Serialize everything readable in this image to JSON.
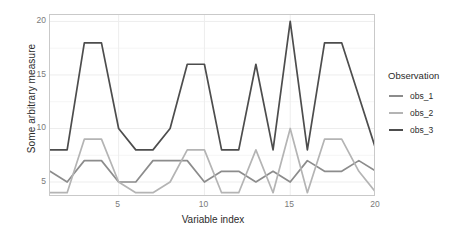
{
  "chart_data": {
    "type": "line",
    "title": "",
    "xlabel": "Variable index",
    "ylabel": "Some arbitrary measure",
    "xlim": [
      1,
      20
    ],
    "ylim": [
      3.6,
      20.6
    ],
    "xticks": [
      5,
      10,
      15,
      20
    ],
    "yticks": [
      5,
      10,
      15,
      20
    ],
    "grid": true,
    "legend_position": "right",
    "legend_title": "Observation",
    "x": [
      1,
      2,
      3,
      4,
      5,
      6,
      7,
      8,
      9,
      10,
      11,
      12,
      13,
      14,
      15,
      16,
      17,
      18,
      19,
      20
    ],
    "series": [
      {
        "name": "obs_1",
        "color": "#8c8c8c",
        "values": [
          6,
          5,
          7,
          7,
          5,
          5,
          7,
          7,
          7,
          5,
          6,
          6,
          5,
          6,
          5,
          7,
          6,
          6,
          7,
          6
        ]
      },
      {
        "name": "obs_2",
        "color": "#b4b4b4",
        "values": [
          4,
          4,
          9,
          9,
          5,
          4,
          4,
          5,
          8,
          8,
          4,
          4,
          8,
          4,
          10,
          4,
          9,
          9,
          6,
          4
        ]
      },
      {
        "name": "obs_3",
        "color": "#4d4d4d",
        "values": [
          8,
          8,
          18,
          18,
          10,
          8,
          8,
          10,
          16,
          16,
          8,
          8,
          16,
          8,
          20,
          8,
          18,
          18,
          13,
          8
        ]
      }
    ]
  },
  "axes": {
    "y_title": "Some arbitrary measure",
    "x_title": "Variable index",
    "y_tick_labels": [
      "20",
      "15",
      "10",
      "5"
    ],
    "x_tick_labels": [
      "5",
      "10",
      "15",
      "20"
    ]
  },
  "legend": {
    "title": "Observation",
    "items": [
      {
        "label": "obs_1"
      },
      {
        "label": "obs_2"
      },
      {
        "label": "obs_3"
      }
    ]
  },
  "colors": {
    "obs_1": "#8c8c8c",
    "obs_2": "#b4b4b4",
    "obs_3": "#4d4d4d",
    "panel_border": "#c9c9c9",
    "grid": "#ededed",
    "tick_text": "#7a7a7a",
    "title_text": "#2b2b2b"
  }
}
